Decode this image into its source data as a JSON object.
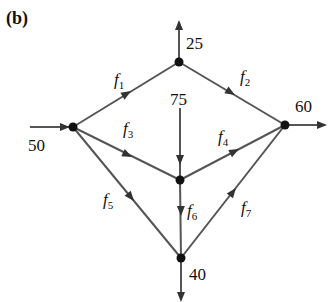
{
  "panel_label": "(b)",
  "top_fragment": "g",
  "colors": {
    "edge": "#555555",
    "arrow": "#333333",
    "node": "#111111",
    "text": "#111111",
    "background": "#ffffff"
  },
  "nodes": [
    {
      "id": "A",
      "x": 73,
      "y": 127
    },
    {
      "id": "B",
      "x": 179,
      "y": 62
    },
    {
      "id": "C",
      "x": 180,
      "y": 180
    },
    {
      "id": "D",
      "x": 285,
      "y": 125
    },
    {
      "id": "E",
      "x": 181,
      "y": 258
    }
  ],
  "edges": [
    {
      "id": "f1",
      "from": "A",
      "to": "B",
      "label": "f",
      "subscript": "1"
    },
    {
      "id": "f2",
      "from": "B",
      "to": "D",
      "label": "f",
      "subscript": "2"
    },
    {
      "id": "f3",
      "from": "A",
      "to": "C",
      "label": "f",
      "subscript": "3"
    },
    {
      "id": "f4",
      "from": "C",
      "to": "D",
      "label": "f",
      "subscript": "4"
    },
    {
      "id": "f5",
      "from": "A",
      "to": "E",
      "label": "f",
      "subscript": "5"
    },
    {
      "id": "f6",
      "from": "C",
      "to": "E",
      "label": "f",
      "subscript": "6"
    },
    {
      "id": "f7",
      "from": "E",
      "to": "D",
      "label": "f",
      "subscript": "7"
    }
  ],
  "external_flows": [
    {
      "node": "A",
      "direction": "in",
      "value": "50"
    },
    {
      "node": "B",
      "direction": "out",
      "value": "25"
    },
    {
      "node": "C",
      "direction": "in",
      "value": "75"
    },
    {
      "node": "D",
      "direction": "out",
      "value": "60"
    },
    {
      "node": "E",
      "direction": "out",
      "value": "40"
    }
  ],
  "labels": {
    "in_50": "50",
    "out_25": "25",
    "in_75": "75",
    "out_60": "60",
    "out_40": "40",
    "f": "f",
    "s1": "1",
    "s2": "2",
    "s3": "3",
    "s4": "4",
    "s5": "5",
    "s6": "6",
    "s7": "7"
  }
}
